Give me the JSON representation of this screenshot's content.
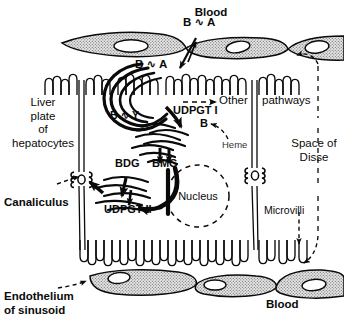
{
  "figure": {
    "type": "biological-schematic"
  },
  "labels": {
    "blood_top": "Blood",
    "blood_bottom": "Blood",
    "b_a_blood": "B ∿ A",
    "b_a_uptake": "B ∿ A",
    "b_y_ligandin": "B ∿ Y",
    "udpgt_1": "UDPGT I",
    "udpgt_2": "UDPGT II",
    "other": "Other",
    "pathways": "pathways",
    "bilirubin_b": "B",
    "heme": "Heme",
    "bdg": "BDG",
    "bmg": "BMG",
    "nucleus": "Nucleus",
    "canaliculus": "Canaliculus",
    "microvilli": "Microvilli",
    "space_of_disse_line1": "Space of",
    "space_of_disse_line2": "Disse",
    "liver_plate_line1": "Liver",
    "liver_plate_line2": "plate",
    "liver_plate_line3": "of",
    "liver_plate_line4": "hepatocytes",
    "endothelium_line1": "Endothelium",
    "endothelium_line2": "of sinusoid"
  },
  "icons": {
    "endothelial_cell": "stippled-cell-icon",
    "endothelial_nucleus": "cell-nucleus-icon",
    "microvilli": "microvilli-icon",
    "canaliculus": "canaliculus-icon",
    "smooth_er": "endoplasmic-reticulum-icon",
    "nucleus_outline": "dashed-nucleus-icon",
    "transport_tube": "transport-tube-icon",
    "solid_arrow": "solid-arrow-icon",
    "dashed_arrow": "dashed-arrow-icon",
    "squiggle_bond": "squiggle-bond-icon"
  },
  "colors": {
    "ink": "#0a0a0a",
    "stipple_fill": "#d9d9d9",
    "background": "#ffffff"
  },
  "geometry": {
    "width": 344,
    "height": 319,
    "top_sinusoid_y": 45,
    "bottom_sinusoid_y": 285,
    "apical_microvilli_y": 80,
    "basal_microvilli_y": 250,
    "cell_boundary_x": [
      78,
      252
    ],
    "disse_dashed_x": 318
  }
}
